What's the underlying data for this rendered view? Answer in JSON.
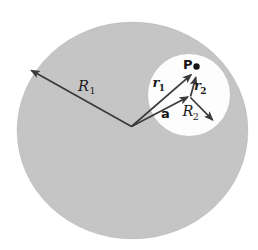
{
  "figure": {
    "background_color": "#ffffff",
    "disk_color": "#c9c9c9",
    "cavity_color": "#fdfdfd",
    "line_color": "#3a3a3a",
    "dot_color": "#161616",
    "text_color": "#1c1c1c",
    "labels": {
      "outer_radius": {
        "base": "R",
        "sub": "1"
      },
      "cavity_radius": {
        "base": "R",
        "sub": "2"
      },
      "vector_r1": {
        "base": "r",
        "sub": "1"
      },
      "vector_r2": {
        "base": "r",
        "sub": "2"
      },
      "vector_a": "a",
      "point": "P"
    }
  }
}
